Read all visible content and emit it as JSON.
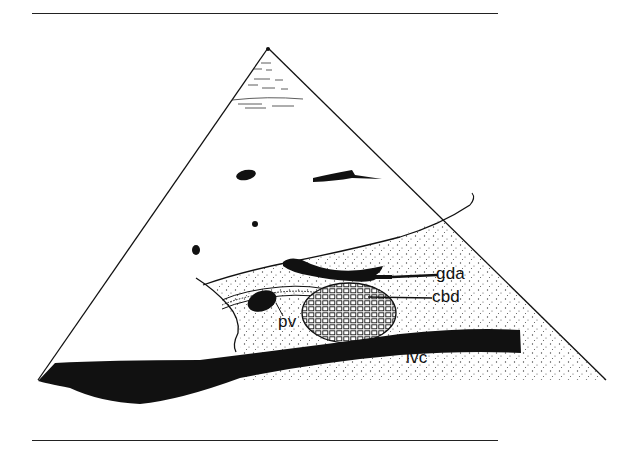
{
  "figure": {
    "type": "ultrasound-sector-schematic",
    "labels": {
      "gda": "gda",
      "cbd": "cbd",
      "pv": "pv",
      "ivc": "ivc"
    },
    "colors": {
      "ink": "#111111",
      "background": "#ffffff",
      "stipple": "#444444"
    }
  }
}
